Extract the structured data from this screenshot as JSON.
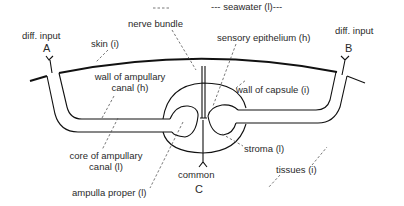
{
  "diagram": {
    "labels": {
      "seawater": "--- seawater (l)---",
      "nerve_bundle": "nerve bundle",
      "diff_input_a": "diff. input",
      "electrode_a": "A",
      "diff_input_b": "diff. input",
      "electrode_b": "B",
      "skin": "skin (i)",
      "sensory_epithelium": "sensory epithelium (h)",
      "wall_ampullary_canal_line1": "wall of ampullary",
      "wall_ampullary_canal_line2": "canal (h)",
      "wall_capsule": "wall of capsule (i)",
      "core_ampullary_canal_line1": "core of ampullary",
      "core_ampullary_canal_line2": "canal (l)",
      "stroma": "stroma (l)",
      "common": "common",
      "electrode_c": "C",
      "ampulla_proper": "ampulla proper (l)",
      "tissues": "tissues (i)"
    },
    "legend_key": {
      "l": "low resistance",
      "i": "intermediate resistance",
      "h": "high resistance"
    },
    "colors": {
      "line": "#111111",
      "text": "#2a2a2a",
      "leader": "#555555",
      "background": "#ffffff"
    }
  }
}
